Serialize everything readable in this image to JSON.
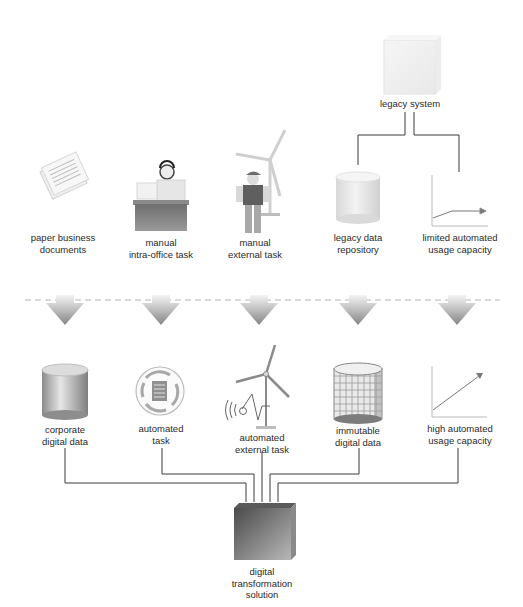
{
  "diagram": {
    "title": "",
    "top_node": {
      "id": "legacy-system",
      "label": "legacy system"
    },
    "before_row": [
      {
        "id": "paper-business-documents",
        "lines": [
          "paper business",
          "documents"
        ],
        "icon": "paper-documents-icon"
      },
      {
        "id": "manual-intra-office-task",
        "lines": [
          "manual",
          "intra-office task"
        ],
        "icon": "office-worker-icon"
      },
      {
        "id": "manual-external-task",
        "lines": [
          "manual",
          "external task"
        ],
        "icon": "field-worker-wind-turbine-icon"
      },
      {
        "id": "legacy-data-repository",
        "lines": [
          "legacy data",
          "repository"
        ],
        "icon": "database-cylinder-icon"
      },
      {
        "id": "limited-automated-usage-capacity",
        "lines": [
          "limited automated",
          "usage capacity"
        ],
        "icon": "flat-growth-chart-icon"
      }
    ],
    "transition": {
      "arrows": 5,
      "separator": "dashed-line"
    },
    "after_row": [
      {
        "id": "corporate-digital-data",
        "lines": [
          "corporate",
          "digital data"
        ],
        "icon": "shaded-database-icon"
      },
      {
        "id": "automated-task",
        "lines": [
          "automated",
          "task"
        ],
        "icon": "automated-cycle-document-icon"
      },
      {
        "id": "automated-external-task",
        "lines": [
          "automated",
          "external task"
        ],
        "icon": "wind-turbine-sensor-icon"
      },
      {
        "id": "immutable-digital-data",
        "lines": [
          "immutable",
          "digital data"
        ],
        "icon": "grid-database-icon"
      },
      {
        "id": "high-automated-usage-capacity",
        "lines": [
          "high automated",
          "usage capacity"
        ],
        "icon": "rising-growth-chart-icon"
      }
    ],
    "bottom_node": {
      "id": "digital-transformation-solution",
      "lines": [
        "digital",
        "transformation",
        "solution"
      ]
    },
    "edges": [
      {
        "from": "legacy-system",
        "to": "legacy-data-repository"
      },
      {
        "from": "legacy-system",
        "to": "limited-automated-usage-capacity"
      },
      {
        "from": "corporate-digital-data",
        "to": "digital-transformation-solution"
      },
      {
        "from": "automated-task",
        "to": "digital-transformation-solution"
      },
      {
        "from": "automated-external-task",
        "to": "digital-transformation-solution"
      },
      {
        "from": "immutable-digital-data",
        "to": "digital-transformation-solution"
      },
      {
        "from": "high-automated-usage-capacity",
        "to": "digital-transformation-solution"
      }
    ],
    "colors": {
      "line": "#3a3a3a",
      "dash": "#b5b5b5",
      "arrow_dark": "#8a8a8a",
      "arrow_light": "#f2f2f2",
      "box_dark": "#4e4e4e",
      "box_light": "#b0b0b0"
    }
  }
}
